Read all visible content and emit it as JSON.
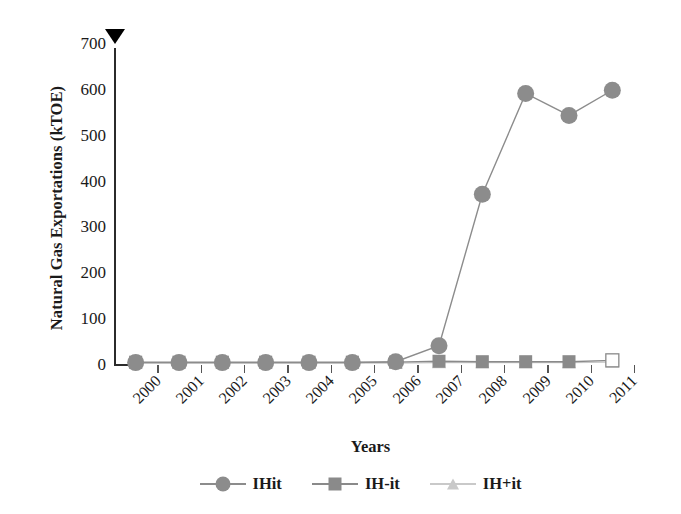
{
  "chart_data": {
    "type": "line",
    "title": "",
    "xlabel": "Years",
    "ylabel": "Natural Gas Exportations (kTOE)",
    "categories": [
      "2000",
      "2001",
      "2002",
      "2003",
      "2004",
      "2005",
      "2006",
      "2007",
      "2008",
      "2009",
      "2010",
      "2011"
    ],
    "series": [
      {
        "name": "IHit",
        "marker": "circle",
        "color": "#8c8c8c",
        "values": [
          3,
          3,
          3,
          3,
          3,
          3,
          5,
          40,
          370,
          590,
          542,
          597
        ]
      },
      {
        "name": "IH-it",
        "marker": "square",
        "color": "#8a8a8a",
        "values": [
          4,
          4,
          4,
          4,
          4,
          4,
          4,
          6,
          5,
          5,
          5,
          8
        ]
      },
      {
        "name": "IH+it",
        "marker": "triangle",
        "color": "#c9c9c9",
        "values": [
          2,
          2,
          2,
          2,
          2,
          2,
          2,
          3,
          3,
          3,
          3,
          4
        ]
      }
    ],
    "ylim": [
      0,
      700
    ],
    "ytick_values": [
      0,
      100,
      200,
      300,
      400,
      500,
      600,
      700
    ],
    "ytick_labels": [
      "0",
      "100",
      "200",
      "300",
      "400",
      "500",
      "600",
      "700"
    ],
    "grid": false,
    "legend_position": "bottom"
  },
  "axes": {
    "y_title": "Natural Gas Exportations (kTOE)",
    "x_title": "Years",
    "axis_cap_icon": "triangle-down-icon",
    "axis_color": "#2b2b2b"
  },
  "legend": {
    "items": [
      {
        "label": "IHit",
        "marker": "circle-marker-icon",
        "color": "#8c8c8c"
      },
      {
        "label": "IH-it",
        "marker": "square-marker-icon",
        "color": "#8a8a8a"
      },
      {
        "label": "IH+it",
        "marker": "triangle-marker-icon",
        "color": "#c9c9c9"
      }
    ]
  }
}
